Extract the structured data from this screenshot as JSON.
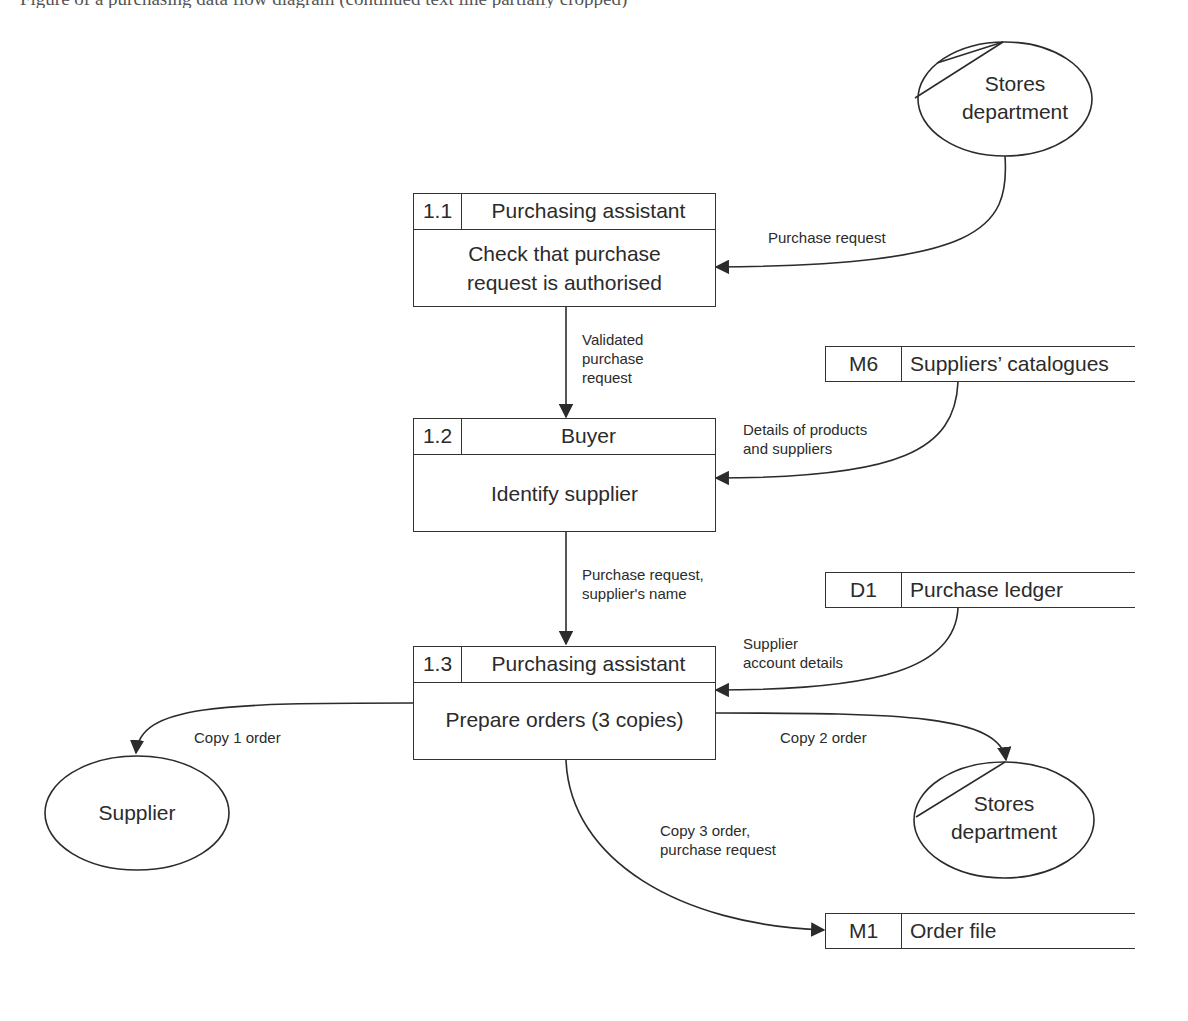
{
  "page": {
    "cutoff_text": "Figure of a purchasing data flow diagram (continued text line partially cropped)"
  },
  "diagram": {
    "type": "data-flow-diagram",
    "processes": [
      {
        "id": "1.1",
        "actor": "Purchasing assistant",
        "description": "Check that purchase request is authorised"
      },
      {
        "id": "1.2",
        "actor": "Buyer",
        "description": "Identify supplier"
      },
      {
        "id": "1.3",
        "actor": "Purchasing assistant",
        "description": "Prepare orders (3 copies)"
      }
    ],
    "external_entities": [
      {
        "name": "Stores department",
        "duplicated": true
      },
      {
        "name": "Supplier",
        "duplicated": false
      },
      {
        "name": "Stores department",
        "duplicated": true
      }
    ],
    "data_stores": [
      {
        "id": "M6",
        "name": "Suppliers’ catalogues"
      },
      {
        "id": "D1",
        "name": "Purchase ledger"
      },
      {
        "id": "M1",
        "name": "Order file"
      }
    ],
    "flows": [
      {
        "label": "Purchase request",
        "from": "Stores department",
        "to": "1.1"
      },
      {
        "label": "Validated purchase request",
        "from": "1.1",
        "to": "1.2"
      },
      {
        "label": "Details of products and suppliers",
        "from": "M6",
        "to": "1.2"
      },
      {
        "label": "Purchase request, supplier's name",
        "from": "1.2",
        "to": "1.3"
      },
      {
        "label": "Supplier account details",
        "from": "D1",
        "to": "1.3"
      },
      {
        "label": "Copy 1 order",
        "from": "1.3",
        "to": "Supplier"
      },
      {
        "label": "Copy 2 order",
        "from": "1.3",
        "to": "Stores department"
      },
      {
        "label": "Copy 3 order, purchase request",
        "from": "1.3",
        "to": "M1"
      }
    ]
  },
  "labels": {
    "p1_id": "1.1",
    "p1_actor": "Purchasing assistant",
    "p1_desc_l1": "Check that purchase",
    "p1_desc_l2": "request is authorised",
    "p2_id": "1.2",
    "p2_actor": "Buyer",
    "p2_desc": "Identify supplier",
    "p3_id": "1.3",
    "p3_actor": "Purchasing assistant",
    "p3_desc": "Prepare orders (3 copies)",
    "e_stores_top_l1": "Stores",
    "e_stores_top_l2": "department",
    "e_supplier": "Supplier",
    "e_stores_bottom_l1": "Stores",
    "e_stores_bottom_l2": "department",
    "ds_m6_id": "M6",
    "ds_m6_name": "Suppliers’ catalogues",
    "ds_d1_id": "D1",
    "ds_d1_name": "Purchase ledger",
    "ds_m1_id": "M1",
    "ds_m1_name": "Order file",
    "f_purchase_request": "Purchase request",
    "f_validated_l1": "Validated",
    "f_validated_l2": "purchase",
    "f_validated_l3": "request",
    "f_details_l1": "Details of products",
    "f_details_l2": "and suppliers",
    "f_pr_supplier_l1": "Purchase request,",
    "f_pr_supplier_l2": "supplier's name",
    "f_account_l1": "Supplier",
    "f_account_l2": "account details",
    "f_copy1": "Copy 1 order",
    "f_copy2": "Copy 2 order",
    "f_copy3_l1": "Copy 3 order,",
    "f_copy3_l2": "purchase request"
  }
}
